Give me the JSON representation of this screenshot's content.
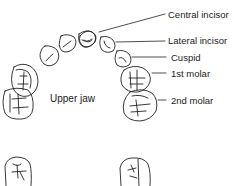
{
  "diagram": {
    "caption": "Upper jaw",
    "labels": [
      {
        "id": "central-incisor",
        "text": "Central incisor"
      },
      {
        "id": "lateral-incisor",
        "text": "Lateral incisor"
      },
      {
        "id": "cuspid",
        "text": "Cuspid"
      },
      {
        "id": "first-molar",
        "text": "1st molar"
      },
      {
        "id": "second-molar",
        "text": "2nd molar"
      }
    ],
    "colors": {
      "line": "#222222",
      "background": "#ffffff"
    }
  }
}
